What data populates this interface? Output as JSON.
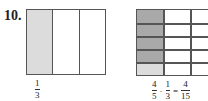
{
  "problem": {
    "number": "10."
  },
  "left_figure": {
    "columns": 3,
    "shaded_columns": 1,
    "shade_color": "#dcdcdc",
    "label": {
      "numerator": "1",
      "denominator": "3"
    }
  },
  "right_figure": {
    "columns": 3,
    "rows": 5,
    "dark_shade_color": "#a9a9a9",
    "light_shade_color": "#dcdcdc",
    "dark_shaded_rows_in_first_column": 4,
    "equation": {
      "term1": {
        "numerator": "4",
        "denominator": "5"
      },
      "operator": "·",
      "term2": {
        "numerator": "1",
        "denominator": "3"
      },
      "equals": "=",
      "result": {
        "numerator": "4",
        "denominator": "15"
      }
    }
  }
}
